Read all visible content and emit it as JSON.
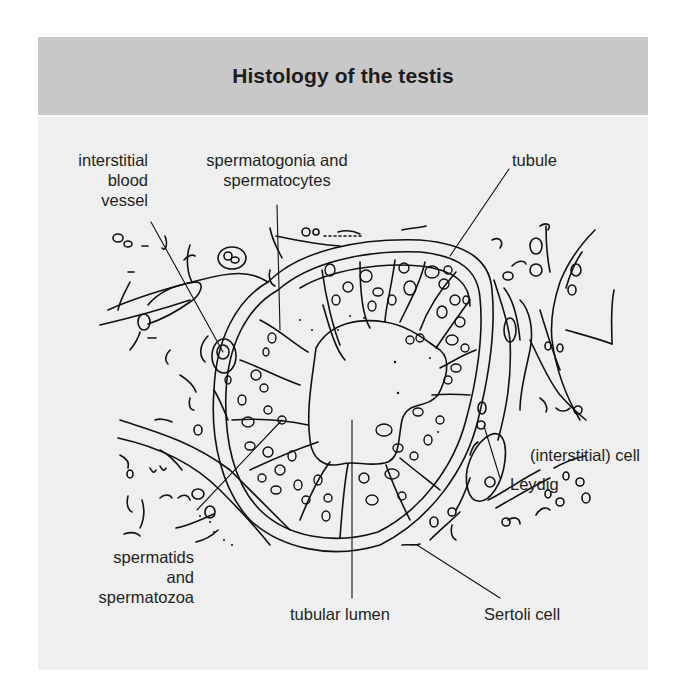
{
  "figure": {
    "title": "Histology of the testis",
    "colors": {
      "header_bg": "#c8c8c8",
      "body_bg": "#efefef",
      "ink": "#231f20"
    }
  },
  "labels": {
    "interstitial_blood_vessel": {
      "line1": "interstitial",
      "line2": "blood",
      "line3": "vessel"
    },
    "spermatogonia": {
      "line1": "spermatogonia and",
      "line2": "spermatocytes"
    },
    "tubule": {
      "line1": "tubule"
    },
    "leydig": {
      "line1": "(interstitial) cell",
      "line2": "Leydig"
    },
    "spermatids": {
      "line1": "spermatids",
      "line2": "and",
      "line3": "spermatozoa"
    },
    "tubular_lumen": {
      "line1": "tubular lumen"
    },
    "sertoli": {
      "line1": "Sertoli cell"
    }
  }
}
